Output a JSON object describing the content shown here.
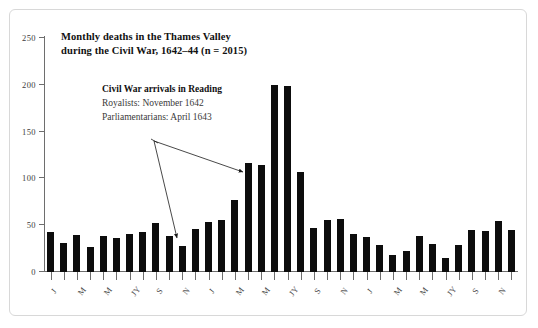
{
  "figure": {
    "title_line_1": "Monthly deaths in the Thames Valley",
    "title_line_2": "during the Civil War, 1642–44  (n = 2015)",
    "annotation_heading": "Civil War arrivals in Reading",
    "annotation_line_1": "Royalists: November 1642",
    "annotation_line_2": "Parliamentarians: April 1643",
    "border_color": "#d8d8d8",
    "bar_color": "#0d0d0d",
    "axis_color": "#6e6e6e",
    "background_color": "#ffffff"
  },
  "chart_data": {
    "type": "bar",
    "title": "Monthly deaths in the Thames Valley during the Civil War, 1642–44  (n = 2015)",
    "xlabel": "",
    "ylabel": "",
    "ylim": [
      0,
      250
    ],
    "yticks": [
      0,
      50,
      100,
      150,
      200,
      250
    ],
    "ytick_labels": [
      "0",
      "50",
      "100",
      "150",
      "200",
      "250"
    ],
    "grid": false,
    "legend": "none",
    "n_total": 2015,
    "categories": [
      "J",
      "F",
      "M",
      "A",
      "M",
      "JN",
      "JY",
      "A",
      "S",
      "O",
      "N",
      "D",
      "J",
      "F",
      "M",
      "A",
      "M",
      "JN",
      "JY",
      "A",
      "S",
      "O",
      "N",
      "D",
      "J",
      "F",
      "M",
      "A",
      "M",
      "JN",
      "JY",
      "A",
      "S",
      "O",
      "N",
      "D"
    ],
    "visible_tick_labels": [
      {
        "index": 0,
        "label": "J"
      },
      {
        "index": 2,
        "label": "M"
      },
      {
        "index": 4,
        "label": "M"
      },
      {
        "index": 6,
        "label": "JY"
      },
      {
        "index": 8,
        "label": "S"
      },
      {
        "index": 10,
        "label": "N"
      },
      {
        "index": 12,
        "label": "J"
      },
      {
        "index": 14,
        "label": "M"
      },
      {
        "index": 16,
        "label": "M"
      },
      {
        "index": 18,
        "label": "JY"
      },
      {
        "index": 20,
        "label": "S"
      },
      {
        "index": 22,
        "label": "N"
      },
      {
        "index": 24,
        "label": "J"
      },
      {
        "index": 26,
        "label": "M"
      },
      {
        "index": 28,
        "label": "M"
      },
      {
        "index": 30,
        "label": "JY"
      },
      {
        "index": 32,
        "label": "S"
      },
      {
        "index": 34,
        "label": "N"
      }
    ],
    "values": [
      43,
      31,
      40,
      27,
      39,
      36,
      41,
      43,
      52,
      39,
      28,
      46,
      53,
      56,
      77,
      116,
      114,
      200,
      199,
      107,
      47,
      56,
      57,
      41,
      37,
      29,
      18,
      22,
      38,
      30,
      15,
      29,
      45,
      44,
      54,
      45
    ]
  }
}
